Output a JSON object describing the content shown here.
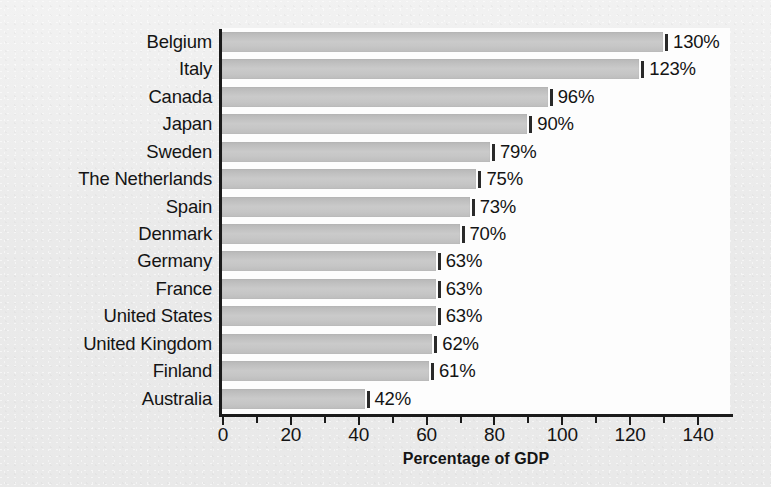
{
  "chart_data": {
    "type": "bar",
    "orientation": "horizontal",
    "title": "",
    "xlabel": "Percentage of GDP",
    "ylabel": "",
    "xlim": [
      0,
      150
    ],
    "xticks": [
      0,
      20,
      40,
      60,
      80,
      100,
      120,
      140
    ],
    "xtick_labels": [
      "0",
      "20",
      "40",
      "60",
      "80",
      "100",
      "120",
      "140"
    ],
    "minor_tick_interval": 10,
    "grid": false,
    "legend": false,
    "categories": [
      "Belgium",
      "Italy",
      "Canada",
      "Japan",
      "Sweden",
      "The Netherlands",
      "Spain",
      "Denmark",
      "Germany",
      "France",
      "United States",
      "United Kingdom",
      "Finland",
      "Australia"
    ],
    "values": [
      130,
      123,
      96,
      90,
      79,
      75,
      73,
      70,
      63,
      63,
      63,
      62,
      61,
      42
    ],
    "data_labels": [
      "130%",
      "123%",
      "96%",
      "90%",
      "79%",
      "75%",
      "73%",
      "70%",
      "63%",
      "63%",
      "63%",
      "62%",
      "61%",
      "42%"
    ],
    "colors": {
      "bar": "#c4c4c4",
      "bar_edge": "#2a2a2a",
      "axis": "#1b1b1b",
      "text": "#141414",
      "plot_background": "#fdfdfd",
      "figure_background": "#ededed"
    }
  }
}
